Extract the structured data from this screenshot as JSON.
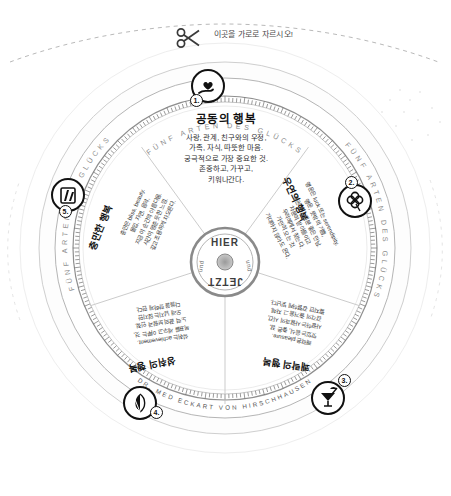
{
  "sheet": {
    "cut_note": "이곳을 가로로 자르시오!",
    "scissors_icon": "scissors-icon"
  },
  "ring": {
    "top_text": "FÜNF ARTEN DES GLÜCKS",
    "left_text": "FÜNF ARTEN DES GLÜCKS",
    "right_text": "FÜNF ARTEN DES GLÜCKS",
    "bottom_text": "DR. MED ECKART VON HIRSCHHAUSEN"
  },
  "hub": {
    "line1": "HIER",
    "line2": "und",
    "line3": "JETZT",
    "line4": "und"
  },
  "center": {
    "title": "공동의 행복",
    "lines": [
      "사랑, 관계, 친구와의 우정,",
      "가족, 자식, 따뜻한 마음.",
      "궁극적으로 가장 중요한 것.",
      "존중하고, 가꾸고,",
      "키워나간다."
    ]
  },
  "segments": [
    {
      "number": "1.",
      "icon": "heart-in-hand-icon",
      "label": "공동의 행복",
      "latin": "shared happiness",
      "body": ""
    },
    {
      "number": "2.",
      "icon": "four-leaf-clover-icon",
      "label": "우연의 행복",
      "latin": "luck, serendipity",
      "body": "행운은 luck 또는 serendipity.\n행운, 뜻밖의 기쁨,\n복권이나 기분 좋은 만남.\n차분히 받아들이고\n우리에게서 찾는다.\n가만히 오는 것.\n기대하지 않아도 온다."
    },
    {
      "number": "3.",
      "icon": "cocktail-glass-icon",
      "label": "쾌락의 행복",
      "latin": "pleasure",
      "body": "쾌락은 pleasure.\n맛있는 음식, 좋은 잠,\n사랑하는 사람과의 시간,\n감각의 즐거움 그 자체.\n짧지만 강렬하게 빛난다."
    },
    {
      "number": "4.",
      "icon": "peacock-fan-icon",
      "label": "성취의 행복",
      "latin": "achievement",
      "body": "성취는 achievement.\n목표를 세우고 이루는 것,\n노력 끝의 보람과 인정.\n오래 남지는 않지만\n다음을 향하게 한다."
    },
    {
      "number": "5.",
      "icon": "flow-state-icon",
      "label": "충만한 행복",
      "latin": "bliss, beauty",
      "body": "충만은 bliss, beauty.\n몰입, 자연, 음악,\n지금 이 순간의 아름다움.\n시간이 멈춘 듯한 느낌.\n깊고 조용하게 차오른다."
    }
  ],
  "colors": {
    "ink": "#111111",
    "paper": "#ffffff",
    "gray": "#8c8c8c",
    "light_gray": "#d8d8d8"
  }
}
